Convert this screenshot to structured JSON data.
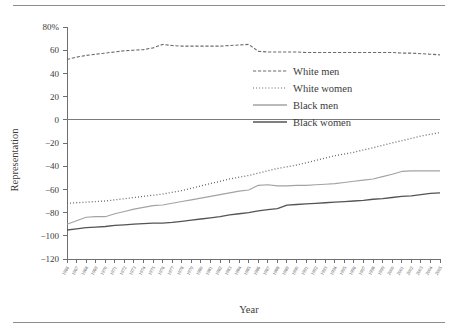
{
  "axes": {
    "ylabel": "Representation",
    "xlabel": "Year",
    "y_ticks": [
      "80%",
      "60",
      "40",
      "20",
      "0",
      "−20",
      "−40",
      "−60",
      "−80",
      "−100",
      "−120"
    ],
    "y_tick_values": [
      80,
      60,
      40,
      20,
      0,
      -20,
      -40,
      -60,
      -80,
      -100,
      -120
    ]
  },
  "legend": {
    "entries": [
      {
        "label": "White men",
        "style": "dashed",
        "color": "#6b6b6b"
      },
      {
        "label": "White women",
        "style": "dotted",
        "color": "#5a5a5a"
      },
      {
        "label": "Black men",
        "style": "solid",
        "color": "#a3a3a3"
      },
      {
        "label": "Black women",
        "style": "solid",
        "color": "#545454"
      }
    ]
  },
  "chart_data": {
    "type": "line",
    "title": "",
    "xlabel": "Year",
    "ylabel": "Representation",
    "ylim": [
      -120,
      80
    ],
    "xlim": [
      1966,
      2005
    ],
    "grid": false,
    "legend_position": "center-right",
    "zero_line": true,
    "x": [
      1966,
      1967,
      1968,
      1969,
      1970,
      1971,
      1972,
      1973,
      1974,
      1975,
      1976,
      1977,
      1978,
      1979,
      1980,
      1981,
      1982,
      1983,
      1984,
      1985,
      1986,
      1987,
      1988,
      1989,
      1990,
      1991,
      1992,
      1993,
      1994,
      1995,
      1996,
      1997,
      1998,
      1999,
      2000,
      2001,
      2002,
      2003,
      2004,
      2005
    ],
    "x_tick_labels": [
      "1966",
      "1967",
      "1968",
      "1969",
      "1970",
      "1971",
      "1972",
      "1973",
      "1974",
      "1975",
      "1976",
      "1977",
      "1978",
      "1979",
      "1980",
      "1981",
      "1982",
      "1983",
      "1984",
      "1985",
      "1986",
      "1987",
      "1988",
      "1989",
      "1990",
      "1991",
      "1992",
      "1993",
      "1994",
      "1995",
      "1996",
      "1997",
      "1998",
      "1999",
      "2000",
      "2001",
      "2002",
      "2003",
      "2004",
      "2005"
    ],
    "series": [
      {
        "name": "White men",
        "style": "dashed",
        "color": "#6b6b6b",
        "width": 1.1,
        "values": [
          52,
          54,
          55.5,
          56.5,
          57.5,
          58.5,
          59.5,
          60,
          60.5,
          62,
          65,
          64,
          63.5,
          63.5,
          63.5,
          63.5,
          63.5,
          64,
          64.5,
          65,
          59,
          58.5,
          58.5,
          58.5,
          58.5,
          58,
          58,
          58,
          58,
          58,
          58,
          58,
          58,
          58,
          58,
          57.5,
          57.5,
          57,
          56.5,
          56
        ]
      },
      {
        "name": "White women",
        "style": "dotted",
        "color": "#5a5a5a",
        "width": 1.3,
        "values": [
          -72,
          -71.5,
          -71,
          -70.5,
          -70,
          -69,
          -68,
          -67,
          -66,
          -65,
          -64,
          -62.5,
          -61,
          -59,
          -57,
          -55,
          -53,
          -51,
          -49.5,
          -48,
          -46,
          -44,
          -42,
          -40.5,
          -39,
          -37,
          -35,
          -33,
          -31,
          -29.5,
          -28,
          -26,
          -24,
          -22,
          -20,
          -18,
          -16,
          -14,
          -12.5,
          -11
        ]
      },
      {
        "name": "Black men",
        "style": "solid",
        "color": "#a3a3a3",
        "width": 1.1,
        "values": [
          -90,
          -87,
          -84,
          -83.5,
          -83.5,
          -81,
          -79,
          -77,
          -75.5,
          -74,
          -73.5,
          -72,
          -70.5,
          -69,
          -67.5,
          -66,
          -64.5,
          -63,
          -61.5,
          -60.5,
          -56.5,
          -56,
          -57,
          -57,
          -56.5,
          -56.5,
          -56,
          -55.5,
          -55,
          -54,
          -53,
          -52,
          -51,
          -49,
          -47,
          -44.5,
          -44,
          -44,
          -44,
          -44
        ]
      },
      {
        "name": "Black women",
        "style": "solid",
        "color": "#545454",
        "width": 1.3,
        "values": [
          -95,
          -94,
          -93,
          -92.5,
          -92,
          -91,
          -90.5,
          -90,
          -89.5,
          -89,
          -89,
          -88.5,
          -87.5,
          -86.5,
          -85.5,
          -84.5,
          -83.5,
          -82,
          -81,
          -80,
          -78.5,
          -77.5,
          -76.5,
          -73.5,
          -73,
          -72.5,
          -72,
          -71.5,
          -71,
          -70.5,
          -70,
          -69.5,
          -68.5,
          -68,
          -67,
          -66,
          -65.5,
          -64.5,
          -63.5,
          -63
        ]
      }
    ]
  }
}
